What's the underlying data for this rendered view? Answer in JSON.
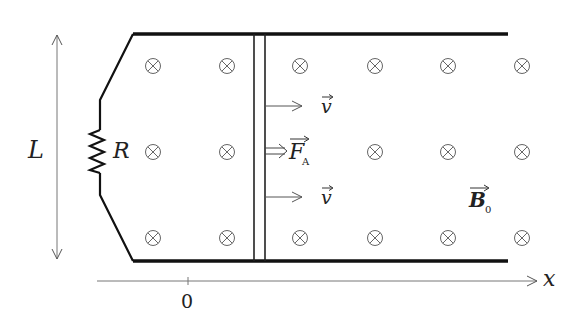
{
  "diagram": {
    "type": "physics-circuit",
    "labels": {
      "length": "L",
      "resistor": "R",
      "velocity_top": "v",
      "velocity_bottom": "v",
      "force": "F",
      "force_subscript": "A",
      "field": "B",
      "field_subscript": "0",
      "axis": "x",
      "origin": "0"
    },
    "field_symbol": "⊗",
    "field_rows": 3,
    "field_columns_left": 2,
    "field_columns_right": 4,
    "colors": {
      "rail": "#111111",
      "line": "#555555",
      "text": "#222222"
    }
  }
}
